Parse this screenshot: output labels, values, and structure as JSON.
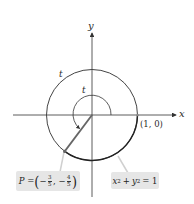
{
  "figure": {
    "axes": {
      "x_label": "x",
      "y_label": "y"
    },
    "circle": {
      "equation_label": "x² + y² = 1",
      "equation_parts": {
        "x": "x",
        "x_exp": "2",
        "plus": "+",
        "y": "y",
        "y_exp": "2",
        "eq": "= 1"
      }
    },
    "point_1_0": {
      "label": "(1, 0)"
    },
    "point_P": {
      "label": "P = (−3/5, −4/5)",
      "prefix": "P =",
      "x_sign": "−",
      "x_num": "3",
      "x_den": "5",
      "y_sign": "−",
      "y_num": "4",
      "y_den": "5"
    },
    "arc_length_label": "t",
    "angle_label": "t",
    "colors": {
      "axis": "#333333",
      "circle": "#333333",
      "radius": "#555555",
      "label_box": "#e6e6e6",
      "leader": "#cccccc"
    }
  }
}
